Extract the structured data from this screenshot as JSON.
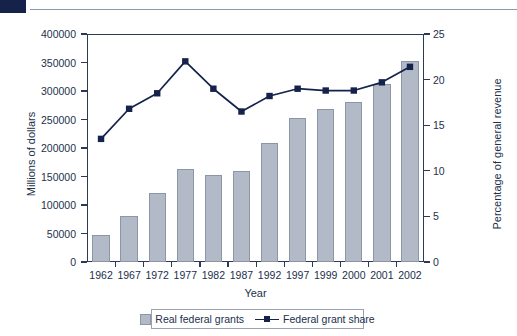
{
  "chart_data": {
    "type": "bar",
    "title": "",
    "subtitle": "",
    "xlabel": "Year",
    "ylabel": "Millions of dollars",
    "y2label": "Percentage of general revenue",
    "categories": [
      "1962",
      "1967",
      "1972",
      "1977",
      "1982",
      "1987",
      "1992",
      "1997",
      "1999",
      "2000",
      "2001",
      "2002"
    ],
    "ylim": [
      0,
      400000
    ],
    "y2lim": [
      0,
      25
    ],
    "yticks": [
      "0",
      "50000",
      "100000",
      "150000",
      "200000",
      "250000",
      "300000",
      "350000",
      "400000"
    ],
    "ytick_values": [
      0,
      50000,
      100000,
      150000,
      200000,
      250000,
      300000,
      350000,
      400000
    ],
    "y2ticks": [
      "0",
      "5",
      "10",
      "15",
      "20",
      "25"
    ],
    "y2tick_values": [
      0,
      5,
      10,
      15,
      20,
      25
    ],
    "grid": false,
    "legend_position": "bottom",
    "series": [
      {
        "name": "Real federal grants",
        "type": "bar",
        "axis": "left",
        "color": "#b2bac7",
        "edge_color": "#8d96a6",
        "values": [
          47000,
          81000,
          121000,
          163000,
          152000,
          160000,
          209000,
          253000,
          268000,
          280000,
          313000,
          353000
        ]
      },
      {
        "name": "Federal grant share",
        "type": "line",
        "axis": "right",
        "color": "#15224a",
        "marker": "square",
        "values": [
          13.5,
          16.8,
          18.5,
          22.0,
          19.0,
          16.5,
          18.2,
          19.0,
          18.8,
          18.8,
          19.7,
          21.4
        ]
      }
    ]
  },
  "legend": {
    "items": [
      {
        "label": "Real federal grants",
        "swatch": "bar-swatch-icon"
      },
      {
        "label": "Federal grant share",
        "swatch": "line-marker-icon"
      }
    ]
  }
}
